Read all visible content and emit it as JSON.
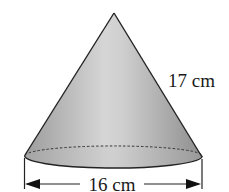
{
  "figure": {
    "shape": "right circular cone",
    "slant_height_label": "17 cm",
    "diameter_label": "16 cm"
  },
  "colors": {
    "fill_light": "#d8d8d8",
    "fill_dark": "#9a9a9a",
    "outline": "#222222",
    "text": "#1a1a1a"
  }
}
